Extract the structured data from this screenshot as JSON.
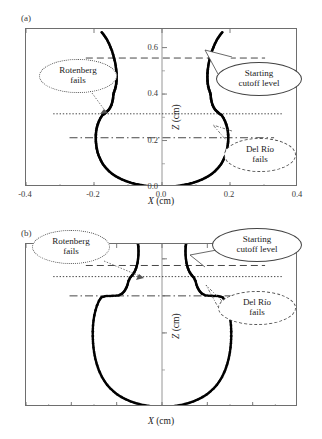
{
  "figure": {
    "panels": [
      {
        "id": "a",
        "label": "(a)",
        "xlabel_var": "X",
        "xlabel_unit": "(cm)",
        "ylabel_var": "Z",
        "ylabel_unit": "(cm)",
        "xticks": [
          "-0.4",
          "-0.2",
          "0.0",
          "0.2",
          "0.4"
        ],
        "yticks": [
          "0.0",
          "0.2",
          "0.4",
          "0.6"
        ],
        "annotations": [
          {
            "name": "rotenberg",
            "text": "Rotenberg\nfails",
            "line_style": "dotted"
          },
          {
            "name": "starting-cutoff",
            "text": "Starting\ncutoff level",
            "line_style": "dashed"
          },
          {
            "name": "del-rio",
            "text": "Del Río\nfails",
            "line_style": "dashdot"
          }
        ]
      },
      {
        "id": "b",
        "label": "(b)",
        "xlabel_var": "X",
        "xlabel_unit": "(cm)",
        "ylabel_var": "Z",
        "ylabel_unit": "(cm)",
        "xticks": [
          "-0.3",
          "-0.2",
          "-0.1",
          "0.0",
          "0.1",
          "0.2",
          "0.3"
        ],
        "yticks": [
          "0.0",
          "0.2",
          "0.4"
        ],
        "annotations": [
          {
            "name": "rotenberg",
            "text": "Rotenberg\nfails",
            "line_style": "dotted"
          },
          {
            "name": "starting-cutoff",
            "text": "Starting\ncutoff level",
            "line_style": "dashed"
          },
          {
            "name": "del-rio",
            "text": "Del Río\nfails",
            "line_style": "dashdot"
          }
        ]
      }
    ],
    "callout_texts": {
      "rotenberg_line1": "Rotenberg",
      "rotenberg_line2": "fails",
      "cutoff_line1": "Starting",
      "cutoff_line2": "cutoff level",
      "delrio_line1": "Del Río",
      "delrio_line2": "fails"
    },
    "colors": {
      "data_points": "#000000",
      "frame": "#6e6e6e",
      "text": "#1a1a1a",
      "reference_line": "#333333"
    }
  },
  "chart_data": [
    {
      "type": "scatter",
      "title": "(a) Pendant drop profile — large Bond number",
      "xlabel": "X (cm)",
      "ylabel": "Z (cm)",
      "xlim": [
        -0.4,
        0.4
      ],
      "ylim": [
        0.0,
        0.68
      ],
      "xticks": [
        -0.4,
        -0.2,
        0.0,
        0.2,
        0.4
      ],
      "yticks": [
        0.0,
        0.2,
        0.4,
        0.6
      ],
      "grid": false,
      "legend": "none",
      "reference_lines": [
        {
          "label": "Starting cutoff level",
          "z": 0.555,
          "style": "dashed"
        },
        {
          "label": "Rotenberg fails",
          "z": 0.315,
          "style": "dotted"
        },
        {
          "label": "Del Río fails",
          "z": 0.212,
          "style": "dashdot"
        }
      ],
      "series": [
        {
          "name": "drop profile (right half)",
          "comment": "z ascending; x = half-width of pendant drop at height z",
          "points": [
            [
              0.0,
              0.0
            ],
            [
              0.012,
              0.0008
            ],
            [
              0.024,
              0.0018
            ],
            [
              0.036,
              0.0032
            ],
            [
              0.048,
              0.0052
            ],
            [
              0.06,
              0.0078
            ],
            [
              0.072,
              0.0112
            ],
            [
              0.084,
              0.0152
            ],
            [
              0.095,
              0.02
            ],
            [
              0.106,
              0.0256
            ],
            [
              0.117,
              0.032
            ],
            [
              0.127,
              0.0392
            ],
            [
              0.137,
              0.0472
            ],
            [
              0.146,
              0.056
            ],
            [
              0.154,
              0.0656
            ],
            [
              0.161,
              0.076
            ],
            [
              0.168,
              0.0872
            ],
            [
              0.174,
              0.099
            ],
            [
              0.179,
              0.1115
            ],
            [
              0.183,
              0.1245
            ],
            [
              0.187,
              0.138
            ],
            [
              0.19,
              0.152
            ],
            [
              0.192,
              0.1664
            ],
            [
              0.1935,
              0.181
            ],
            [
              0.1945,
              0.1958
            ],
            [
              0.1948,
              0.212
            ],
            [
              0.1945,
              0.227
            ],
            [
              0.1935,
              0.242
            ],
            [
              0.1915,
              0.2565
            ],
            [
              0.1888,
              0.2705
            ],
            [
              0.1852,
              0.284
            ],
            [
              0.1808,
              0.2968
            ],
            [
              0.1755,
              0.309
            ],
            [
              0.1695,
              0.315
            ],
            [
              0.164,
              0.322
            ],
            [
              0.158,
              0.33
            ],
            [
              0.153,
              0.34
            ],
            [
              0.149,
              0.352
            ],
            [
              0.146,
              0.366
            ],
            [
              0.144,
              0.381
            ],
            [
              0.1432,
              0.396
            ],
            [
              0.1412,
              0.408
            ],
            [
              0.1382,
              0.42
            ],
            [
              0.136,
              0.432
            ],
            [
              0.1345,
              0.445
            ],
            [
              0.1338,
              0.459
            ],
            [
              0.1335,
              0.474
            ],
            [
              0.1338,
              0.49
            ],
            [
              0.1348,
              0.506
            ],
            [
              0.1362,
              0.522
            ],
            [
              0.1382,
              0.538
            ],
            [
              0.1408,
              0.554
            ],
            [
              0.1438,
              0.57
            ],
            [
              0.1472,
              0.586
            ],
            [
              0.1512,
              0.601
            ],
            [
              0.1556,
              0.616
            ],
            [
              0.1604,
              0.63
            ],
            [
              0.1656,
              0.643
            ],
            [
              0.1712,
              0.655
            ],
            [
              0.1772,
              0.666
            ]
          ]
        }
      ]
    },
    {
      "type": "scatter",
      "title": "(b) Pendant drop profile — small Bond number",
      "xlabel": "X (cm)",
      "ylabel": "Z (cm)",
      "xlim": [
        -0.3,
        0.3
      ],
      "ylim": [
        0.0,
        0.44
      ],
      "xticks": [
        -0.3,
        -0.2,
        -0.1,
        0.0,
        0.1,
        0.2,
        0.3
      ],
      "yticks": [
        0.0,
        0.2,
        0.4
      ],
      "grid": false,
      "legend": "none",
      "reference_lines": [
        {
          "label": "Starting cutoff level",
          "z": 0.382,
          "style": "dashed"
        },
        {
          "label": "Rotenberg fails",
          "z": 0.352,
          "style": "dotted"
        },
        {
          "label": "Del Río fails",
          "z": 0.3,
          "style": "dashdot"
        }
      ],
      "series": [
        {
          "name": "drop profile (right half)",
          "comment": "z ascending; x = half-width of pendant drop at height z",
          "points": [
            [
              0.0,
              0.0
            ],
            [
              0.01,
              0.0006
            ],
            [
              0.02,
              0.0016
            ],
            [
              0.03,
              0.003
            ],
            [
              0.04,
              0.005
            ],
            [
              0.05,
              0.0078
            ],
            [
              0.06,
              0.0112
            ],
            [
              0.07,
              0.0154
            ],
            [
              0.08,
              0.0206
            ],
            [
              0.089,
              0.0266
            ],
            [
              0.098,
              0.0334
            ],
            [
              0.106,
              0.0412
            ],
            [
              0.114,
              0.05
            ],
            [
              0.121,
              0.0596
            ],
            [
              0.127,
              0.07
            ],
            [
              0.1325,
              0.0812
            ],
            [
              0.1372,
              0.0932
            ],
            [
              0.1412,
              0.1058
            ],
            [
              0.1446,
              0.119
            ],
            [
              0.1474,
              0.1326
            ],
            [
              0.1496,
              0.1466
            ],
            [
              0.1512,
              0.1608
            ],
            [
              0.1522,
              0.1754
            ],
            [
              0.1527,
              0.19
            ],
            [
              0.1527,
              0.2048
            ],
            [
              0.1522,
              0.2194
            ],
            [
              0.151,
              0.2338
            ],
            [
              0.1492,
              0.2478
            ],
            [
              0.1466,
              0.2614
            ],
            [
              0.1432,
              0.2744
            ],
            [
              0.139,
              0.2866
            ],
            [
              0.1338,
              0.2962
            ],
            [
              0.123,
              0.2996
            ],
            [
              0.11,
              0.3
            ],
            [
              0.096,
              0.301
            ],
            [
              0.088,
              0.306
            ],
            [
              0.0828,
              0.313
            ],
            [
              0.079,
              0.321
            ],
            [
              0.076,
              0.33
            ],
            [
              0.074,
              0.34
            ],
            [
              0.0706,
              0.3486
            ],
            [
              0.066,
              0.3552
            ],
            [
              0.062,
              0.362
            ],
            [
              0.0586,
              0.37
            ],
            [
              0.056,
              0.379
            ],
            [
              0.054,
              0.389
            ],
            [
              0.0528,
              0.3995
            ],
            [
              0.052,
              0.41
            ],
            [
              0.0518,
              0.421
            ],
            [
              0.0522,
              0.432
            ],
            [
              0.053,
              0.44
            ]
          ]
        }
      ]
    }
  ]
}
